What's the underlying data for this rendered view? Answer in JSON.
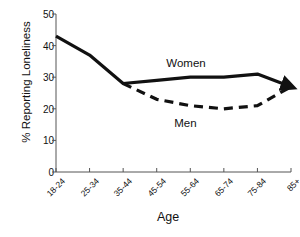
{
  "chart_data": {
    "type": "line",
    "title": "",
    "xlabel": "Age",
    "ylabel": "% Reporting Loneliness",
    "categories": [
      "18-24",
      "25-34",
      "35-44",
      "45-54",
      "55-64",
      "65-74",
      "75-84",
      "85+"
    ],
    "ylim": [
      0,
      50
    ],
    "yticks": [
      0,
      10,
      20,
      30,
      40,
      50
    ],
    "grid": false,
    "legend_position": "inline-annotation",
    "series": [
      {
        "name": "Women",
        "style": "solid",
        "color": "#111111",
        "values": [
          43,
          37,
          28,
          29,
          30,
          30,
          31,
          27
        ]
      },
      {
        "name": "Men",
        "style": "dashed",
        "color": "#111111",
        "values": [
          null,
          null,
          28,
          23,
          21,
          20,
          21,
          27
        ]
      }
    ],
    "annotations": [
      {
        "text": "Women",
        "x_category": "55-64",
        "y_value": 34
      },
      {
        "text": "Men",
        "x_category": "55-64",
        "y_value": 15
      }
    ]
  }
}
